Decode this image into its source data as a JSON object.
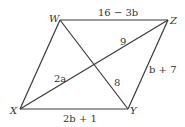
{
  "diagram": {
    "type": "parallelogram",
    "vertices": {
      "W": {
        "label": "W",
        "x": 60,
        "y": 20
      },
      "Z": {
        "label": "Z",
        "x": 168,
        "y": 20
      },
      "Y": {
        "label": "Y",
        "x": 128,
        "y": 109
      },
      "X": {
        "label": "X",
        "x": 20,
        "y": 109
      }
    },
    "edge_labels": {
      "WZ": "16 − 3b",
      "ZY": "b + 7",
      "XY": "2b + 1"
    },
    "diagonal_labels": {
      "Z_to_center": "9",
      "Y_to_center": "8",
      "X_to_center": "2a"
    },
    "colors": {
      "stroke": "#3a3a3a",
      "text": "#333333",
      "background": "#ffffff"
    }
  }
}
